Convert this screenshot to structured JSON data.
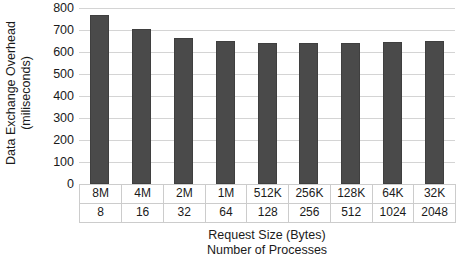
{
  "chart_data": {
    "type": "bar",
    "title": "",
    "categories": [
      "8M",
      "4M",
      "2M",
      "1M",
      "512K",
      "256K",
      "128K",
      "64K",
      "32K"
    ],
    "secondary_categories": [
      "8",
      "16",
      "32",
      "64",
      "128",
      "256",
      "512",
      "1024",
      "2048"
    ],
    "values": [
      770,
      705,
      665,
      650,
      640,
      640,
      640,
      645,
      650
    ],
    "xlabel": "Request Size (Bytes)",
    "xlabel_secondary": "Number of Processes",
    "ylabel": "Data Exchange Overhead (miliseconds)",
    "ylabel_line1": "Data Exchange Overhead",
    "ylabel_line2": "(miliseconds)",
    "ylim": [
      0,
      800
    ],
    "ytick_values": [
      800,
      700,
      600,
      500,
      400,
      300,
      200,
      100,
      0
    ],
    "ytick_labels": [
      "800",
      "700",
      "600",
      "500",
      "400",
      "300",
      "200",
      "100",
      "0"
    ],
    "grid": true,
    "legend": false,
    "bar_color": "#4a4a4a",
    "gridline_color": "#d4d4d4",
    "background_color": "#ffffff"
  }
}
